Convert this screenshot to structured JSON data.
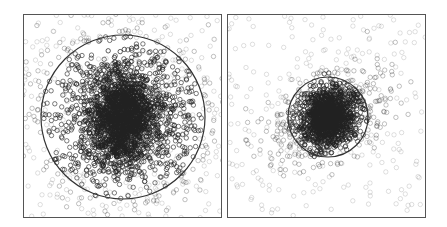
{
  "chart_data": [
    {
      "type": "scatter",
      "title": "",
      "xlabel": "",
      "ylabel": "",
      "grid": false,
      "legend": null,
      "panel": "left",
      "frame_px": {
        "x": 23,
        "y": 14,
        "w": 199,
        "h": 204
      },
      "cluster": {
        "cx": 123,
        "cy": 117,
        "sx": 38,
        "sy": 36,
        "core_sx": 14,
        "core_sy": 22,
        "rotation_deg": 0
      },
      "outer_points": 300,
      "inner_points": 1400,
      "core_points": 1200,
      "circle": {
        "cx": 123,
        "cy": 117,
        "r": 82
      },
      "marker": {
        "shape": "open-circle",
        "radius": 2.2,
        "color": "#222222"
      }
    },
    {
      "type": "scatter",
      "title": "",
      "xlabel": "",
      "ylabel": "",
      "grid": false,
      "legend": null,
      "panel": "right",
      "frame_px": {
        "x": 227,
        "y": 14,
        "w": 199,
        "h": 204
      },
      "cluster": {
        "cx": 328,
        "cy": 117,
        "sx": 30,
        "sy": 18,
        "core_sx": 11,
        "core_sy": 13,
        "rotation_deg": -30
      },
      "outer_points": 250,
      "inner_points": 700,
      "core_points": 900,
      "circle": {
        "cx": 328,
        "cy": 117,
        "r": 40
      },
      "marker": {
        "shape": "open-circle",
        "radius": 2.2,
        "color": "#222222"
      }
    }
  ],
  "colors": {
    "frame": "#555555",
    "circle": "#333333",
    "marker": "#222222",
    "background": "#ffffff"
  }
}
